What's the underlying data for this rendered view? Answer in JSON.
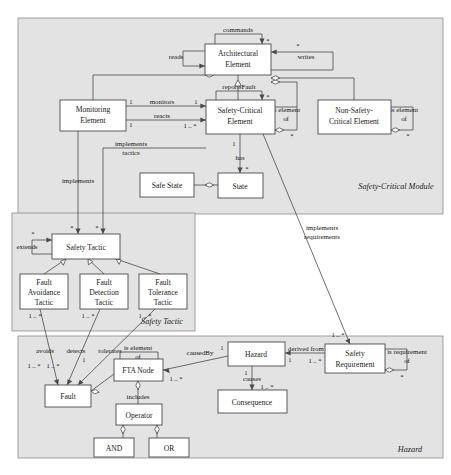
{
  "diagram": {
    "packages": [
      {
        "id": "pkg-safety-critical-module",
        "label": "Safety-Critical Module",
        "x": 18,
        "y": 18,
        "w": 425,
        "h": 196
      },
      {
        "id": "pkg-safety-tactic",
        "label": "Safety Tactic",
        "x": 12,
        "y": 213,
        "w": 183,
        "h": 118
      },
      {
        "id": "pkg-hazard",
        "label": "Hazard",
        "x": 18,
        "y": 336,
        "w": 425,
        "h": 122
      }
    ],
    "classes": [
      {
        "id": "architectural-element",
        "name": "Architectural\nElement",
        "lines": [
          "Architectural",
          "Element"
        ],
        "x": 205,
        "y": 44,
        "w": 66,
        "h": 31
      },
      {
        "id": "monitoring-element",
        "name": "Monitoring Element",
        "lines": [
          "Monitoring",
          "Element"
        ],
        "x": 60,
        "y": 100,
        "w": 66,
        "h": 31
      },
      {
        "id": "safety-critical-element",
        "name": "Safety-Critical Element",
        "lines": [
          "Safety-Critical",
          "Element"
        ],
        "x": 206,
        "y": 100,
        "w": 69,
        "h": 34
      },
      {
        "id": "non-safety-critical-element",
        "name": "Non-Safety-Critical Element",
        "lines": [
          "Non-Safety-",
          "Critical Element"
        ],
        "x": 318,
        "y": 100,
        "w": 73,
        "h": 34
      },
      {
        "id": "safe-state",
        "name": "Safe State",
        "lines": [
          "Safe State"
        ],
        "x": 140,
        "y": 173,
        "w": 54,
        "h": 24
      },
      {
        "id": "state",
        "name": "State",
        "lines": [
          "State"
        ],
        "x": 218,
        "y": 173,
        "w": 45,
        "h": 25
      },
      {
        "id": "safety-tactic",
        "name": "Safety Tactic",
        "lines": [
          "Safety Tactic"
        ],
        "x": 52,
        "y": 234,
        "w": 68,
        "h": 25
      },
      {
        "id": "fault-avoidance-tactic",
        "name": "Fault Avoidance Tactic",
        "lines": [
          "Fault",
          "Avoidance",
          "Tactic"
        ],
        "x": 20,
        "y": 274,
        "w": 48,
        "h": 35
      },
      {
        "id": "fault-detection-tactic",
        "name": "Fault Detection Tactic",
        "lines": [
          "Fault",
          "Detection",
          "Tactic"
        ],
        "x": 80,
        "y": 274,
        "w": 48,
        "h": 35
      },
      {
        "id": "fault-tolerance-tactic",
        "name": "Fault Tolerance Tactic",
        "lines": [
          "Fault",
          "Tolerance",
          "Tactic"
        ],
        "x": 139,
        "y": 274,
        "w": 48,
        "h": 35
      },
      {
        "id": "fault",
        "name": "Fault",
        "lines": [
          "Fault"
        ],
        "x": 45,
        "y": 385,
        "w": 46,
        "h": 22
      },
      {
        "id": "fta-node",
        "name": "FTA Node",
        "lines": [
          "FTA Node"
        ],
        "x": 114,
        "y": 359,
        "w": 49,
        "h": 22
      },
      {
        "id": "operator",
        "name": "Operator",
        "lines": [
          "Operator"
        ],
        "x": 116,
        "y": 404,
        "w": 46,
        "h": 21
      },
      {
        "id": "and-node",
        "name": "AND",
        "lines": [
          "AND"
        ],
        "x": 94,
        "y": 438,
        "w": 40,
        "h": 19
      },
      {
        "id": "or-node",
        "name": "OR",
        "lines": [
          "OR"
        ],
        "x": 149,
        "y": 438,
        "w": 40,
        "h": 19
      },
      {
        "id": "hazard",
        "name": "Hazard",
        "lines": [
          "Hazard"
        ],
        "x": 228,
        "y": 342,
        "w": 57,
        "h": 24
      },
      {
        "id": "consequence",
        "name": "Consequence",
        "lines": [
          "Consequence"
        ],
        "x": 218,
        "y": 390,
        "w": 69,
        "h": 23
      },
      {
        "id": "safety-requirement",
        "name": "Safety Requirement",
        "lines": [
          "Safety",
          "Requirement"
        ],
        "x": 325,
        "y": 344,
        "w": 60,
        "h": 29
      }
    ],
    "relations": [
      {
        "id": "rel-commands",
        "label": "commands",
        "from": "architectural-element",
        "to": "architectural-element",
        "kind": "self-association",
        "mult_to": "*"
      },
      {
        "id": "rel-reads",
        "label": "reads",
        "from": "monitoring-element",
        "to": "architectural-element",
        "kind": "association"
      },
      {
        "id": "rel-writes",
        "label": "writes",
        "from": "architectural-element",
        "to": "architectural-element",
        "kind": "association",
        "mult_to": "*"
      },
      {
        "id": "rel-reports-fault",
        "label": "reportsFault",
        "from": "safety-critical-element",
        "to": "safety-critical-element",
        "kind": "self-association",
        "mult_to": "*"
      },
      {
        "id": "rel-monitors",
        "label": "monitors",
        "from": "monitoring-element",
        "to": "safety-critical-element",
        "kind": "association",
        "mult_from": "1",
        "mult_to": "1 .. *"
      },
      {
        "id": "rel-reacts",
        "label": "reacts",
        "from": "monitoring-element",
        "to": "safety-critical-element",
        "kind": "association",
        "mult_from": "1",
        "mult_to": "1 .. *"
      },
      {
        "id": "rel-is-element-of-sce",
        "label": "is element of",
        "from": "safety-critical-element",
        "to": "architectural-element",
        "kind": "aggregation",
        "mult_to": "*"
      },
      {
        "id": "rel-is-element-of-nsce",
        "label": "is element of",
        "from": "non-safety-critical-element",
        "to": "architectural-element",
        "kind": "aggregation",
        "mult_to": "*"
      },
      {
        "id": "rel-has",
        "label": "has",
        "from": "safety-critical-element",
        "to": "state",
        "kind": "association",
        "mult_from": "1",
        "mult_to": "*"
      },
      {
        "id": "rel-safe-state",
        "label": "",
        "from": "safe-state",
        "to": "state",
        "kind": "aggregation"
      },
      {
        "id": "rel-implements",
        "label": "implements",
        "from": "monitoring-element",
        "to": "safety-tactic",
        "kind": "association",
        "mult_to": "*"
      },
      {
        "id": "rel-implements-tactics",
        "label": "implements tactics",
        "from": "safety-critical-element",
        "to": "safety-tactic",
        "kind": "association",
        "mult_to": "*"
      },
      {
        "id": "rel-extends",
        "label": "extends",
        "from": "safety-tactic",
        "to": "safety-tactic",
        "kind": "self-association",
        "mult_to": "*"
      },
      {
        "id": "rel-gen-avoidance",
        "label": "",
        "from": "fault-avoidance-tactic",
        "to": "safety-tactic",
        "kind": "generalization"
      },
      {
        "id": "rel-gen-detection",
        "label": "",
        "from": "fault-detection-tactic",
        "to": "safety-tactic",
        "kind": "generalization"
      },
      {
        "id": "rel-gen-tolerance",
        "label": "",
        "from": "fault-tolerance-tactic",
        "to": "safety-tactic",
        "kind": "generalization"
      },
      {
        "id": "rel-avoids",
        "label": "avoids",
        "from": "fault-avoidance-tactic",
        "to": "fault",
        "kind": "association",
        "mult_from": "1 .. *",
        "mult_to": "1 .. *"
      },
      {
        "id": "rel-detects",
        "label": "detects",
        "from": "fault-detection-tactic",
        "to": "fault",
        "kind": "association",
        "mult_from": "1 .. *",
        "mult_to": "1 .. *"
      },
      {
        "id": "rel-tolerates",
        "label": "tolerates",
        "from": "fault-tolerance-tactic",
        "to": "fault",
        "kind": "association",
        "mult_from": "1 .. *",
        "mult_to": "1"
      },
      {
        "id": "rel-is-element-of-fta",
        "label": "is element of",
        "from": "fault",
        "to": "fta-node",
        "kind": "aggregation"
      },
      {
        "id": "rel-includes",
        "label": "includes",
        "from": "fta-node",
        "to": "operator",
        "kind": "aggregation"
      },
      {
        "id": "rel-and",
        "label": "",
        "from": "and-node",
        "to": "operator",
        "kind": "aggregation"
      },
      {
        "id": "rel-or",
        "label": "",
        "from": "or-node",
        "to": "operator",
        "kind": "aggregation"
      },
      {
        "id": "rel-caused-by",
        "label": "causedBy",
        "from": "hazard",
        "to": "fta-node",
        "kind": "association",
        "mult_from": "1",
        "mult_to": "1 .. *"
      },
      {
        "id": "rel-causes",
        "label": "causes",
        "from": "hazard",
        "to": "consequence",
        "kind": "association",
        "mult_from": "1",
        "mult_to": "1 .. *"
      },
      {
        "id": "rel-derived-from",
        "label": "derived from",
        "from": "safety-requirement",
        "to": "hazard",
        "kind": "association",
        "mult_from": "1 .. *",
        "mult_to": "1"
      },
      {
        "id": "rel-is-requirement-of",
        "label": "is requirement of",
        "from": "safety-requirement",
        "to": "safety-requirement",
        "kind": "aggregation",
        "mult_to": "*"
      },
      {
        "id": "rel-implements-requirements",
        "label": "implements requirements",
        "from": "safety-critical-element",
        "to": "safety-requirement",
        "kind": "association",
        "mult_from": "1",
        "mult_to": "1 .. *"
      }
    ],
    "labels": {
      "commands": "commands",
      "reads": "reads",
      "writes": "writes",
      "reports_fault": "reportsFault",
      "monitors": "monitors",
      "reacts": "reacts",
      "is_element_of_1": "is element",
      "is_element_of_1b": "of",
      "is_element_of_2": "is element",
      "is_element_of_2b": "of",
      "has": "has",
      "implements": "implements",
      "implements_tactics_1": "implements",
      "implements_tactics_2": "tactics",
      "extends": "extends",
      "avoids": "avoids",
      "detects": "detects",
      "tolerates": "tolerates",
      "is_element_of_fta_1": "is element",
      "is_element_of_fta_2": "of",
      "includes": "includes",
      "caused_by": "causedBy",
      "causes": "causes",
      "derived_from": "derived from",
      "is_requirement_of_1": "is requirement",
      "is_requirement_of_2": "of",
      "implements_requirements_1": "implements",
      "implements_requirements_2": "requirements"
    },
    "multiplicities": {
      "star": "*",
      "one": "1",
      "one_to_many": "1 .. *"
    },
    "colors": {
      "package_fill": "#e3e3e3",
      "package_stroke": "#8c8c8c",
      "class_fill": "#ffffff",
      "class_stroke": "#4a4a4a",
      "line": "#4a4a4a",
      "text": "#1a1a1a",
      "background": "#ffffff"
    }
  }
}
